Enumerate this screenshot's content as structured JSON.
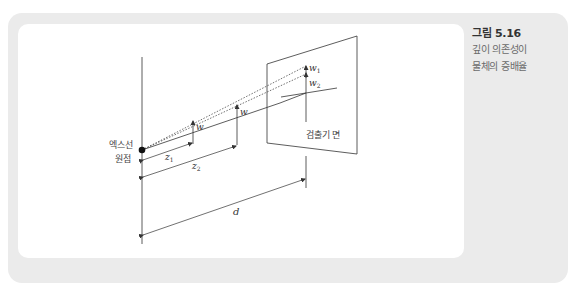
{
  "caption": {
    "number": "그림 5.16",
    "text_line1": "깊이 의존성이",
    "text_line2": "물체의 증배율"
  },
  "diagram": {
    "source_label_line1": "엑스선",
    "source_label_line2": "원점",
    "detector_label": "검출기 면",
    "object_size_label_1": "w",
    "object_size_label_2": "w",
    "image_size_label_1": "w",
    "image_size_label_1_sub": "1",
    "image_size_label_2": "w",
    "image_size_label_2_sub": "2",
    "distance_label_1": "z",
    "distance_label_1_sub": "1",
    "distance_label_2": "z",
    "distance_label_2_sub": "2",
    "distance_label_d": "d"
  },
  "colors": {
    "panel_bg": "#ebebeb",
    "card_bg": "#ffffff",
    "line": "#333333"
  }
}
